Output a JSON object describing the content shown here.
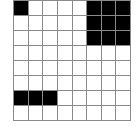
{
  "grid": {
    "rows": 8,
    "cols": 8,
    "fill_color": "#000000",
    "empty_color": "#ffffff",
    "line_color": "#8a8a8a",
    "cells": [
      [
        1,
        0,
        0,
        0,
        0,
        1,
        1,
        1
      ],
      [
        0,
        0,
        0,
        0,
        0,
        1,
        1,
        1
      ],
      [
        0,
        0,
        0,
        0,
        0,
        1,
        1,
        1
      ],
      [
        0,
        0,
        0,
        0,
        0,
        0,
        0,
        0
      ],
      [
        0,
        0,
        0,
        0,
        0,
        0,
        0,
        0
      ],
      [
        0,
        0,
        0,
        0,
        0,
        0,
        0,
        0
      ],
      [
        1,
        1,
        1,
        0,
        0,
        0,
        0,
        0
      ],
      [
        0,
        0,
        0,
        0,
        0,
        0,
        0,
        0
      ]
    ]
  }
}
